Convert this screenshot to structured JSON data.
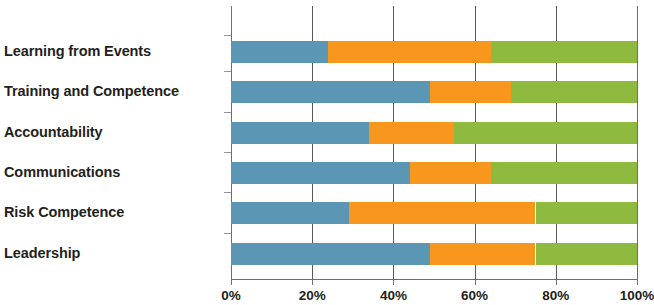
{
  "chart_data": {
    "type": "bar",
    "orientation": "horizontal",
    "stacked": true,
    "stack_mode": "percent",
    "title": "",
    "subtitle": "",
    "xlabel": "",
    "ylabel": "",
    "xlim": [
      0,
      100
    ],
    "grid": true,
    "legend": false,
    "legend_position": "none",
    "xtick_labels": [
      "0%",
      "20%",
      "40%",
      "60%",
      "80%",
      "100%"
    ],
    "xtick_values": [
      0,
      20,
      40,
      60,
      80,
      100
    ],
    "categories": [
      "Learning from Events",
      "Training and Competence",
      "Accountability",
      "Communications",
      "Risk Competence",
      "Leadership"
    ],
    "series": [
      {
        "name": "blue",
        "color": "#5b96b5",
        "values": [
          24,
          49,
          34,
          44,
          29,
          49
        ]
      },
      {
        "name": "orange",
        "color": "#f7971d",
        "values": [
          40,
          20,
          21,
          20,
          46,
          26
        ]
      },
      {
        "name": "green",
        "color": "#8dba3f",
        "values": [
          36,
          31,
          45,
          36,
          25,
          25
        ]
      }
    ],
    "colors": {
      "series_blue": "#5b96b5",
      "series_orange": "#f7971d",
      "series_green": "#8dba3f",
      "axis": "#6d6e71",
      "gridline": "#58595b",
      "text": "#231f20",
      "background": "#ffffff"
    }
  }
}
